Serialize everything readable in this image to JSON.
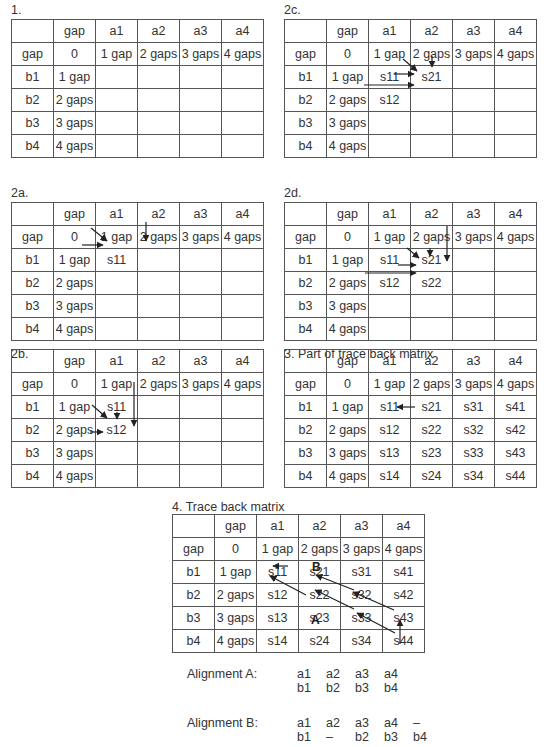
{
  "columns": [
    "",
    "gap",
    "a1",
    "a2",
    "a3",
    "a4"
  ],
  "panels": [
    {
      "id": "p1",
      "title": "1.",
      "rows": [
        [
          "gap",
          "0",
          "1 gap",
          "2 gaps",
          "3 gaps",
          "4 gaps"
        ],
        [
          "b1",
          "1 gap",
          "",
          "",
          "",
          ""
        ],
        [
          "b2",
          "2 gaps",
          "",
          "",
          "",
          ""
        ],
        [
          "b3",
          "3 gaps",
          "",
          "",
          "",
          ""
        ],
        [
          "b4",
          "4 gaps",
          "",
          "",
          "",
          ""
        ]
      ]
    },
    {
      "id": "p2c",
      "title": "2c.",
      "rows": [
        [
          "gap",
          "0",
          "1 gap",
          "2 gaps",
          "3 gaps",
          "4 gaps"
        ],
        [
          "b1",
          "1 gap",
          "s11",
          "s21",
          "",
          ""
        ],
        [
          "b2",
          "2 gaps",
          "s12",
          "",
          "",
          ""
        ],
        [
          "b3",
          "3 gaps",
          "",
          "",
          "",
          ""
        ],
        [
          "b4",
          "4 gaps",
          "",
          "",
          "",
          ""
        ]
      ]
    },
    {
      "id": "p2a",
      "title": "2a.",
      "rows": [
        [
          "gap",
          "0",
          "1 gap",
          "2 gaps",
          "3 gaps",
          "4 gaps"
        ],
        [
          "b1",
          "1 gap",
          "s11",
          "",
          "",
          ""
        ],
        [
          "b2",
          "2 gaps",
          "",
          "",
          "",
          ""
        ],
        [
          "b3",
          "3 gaps",
          "",
          "",
          "",
          ""
        ],
        [
          "b4",
          "4 gaps",
          "",
          "",
          "",
          ""
        ]
      ]
    },
    {
      "id": "p2d",
      "title": "2d.",
      "rows": [
        [
          "gap",
          "0",
          "1 gap",
          "2 gaps",
          "3 gaps",
          "4 gaps"
        ],
        [
          "b1",
          "1 gap",
          "s11",
          "s21",
          "",
          ""
        ],
        [
          "b2",
          "2 gaps",
          "s12",
          "s22",
          "",
          ""
        ],
        [
          "b3",
          "3 gaps",
          "",
          "",
          "",
          ""
        ],
        [
          "b4",
          "4 gaps",
          "",
          "",
          "",
          ""
        ]
      ]
    },
    {
      "id": "p2b",
      "title": "2b.",
      "rows": [
        [
          "gap",
          "0",
          "1 gap",
          "2 gaps",
          "3 gaps",
          "4 gaps"
        ],
        [
          "b1",
          "1 gap",
          "s11",
          "",
          "",
          ""
        ],
        [
          "b2",
          "2 gaps",
          "s12",
          "",
          "",
          ""
        ],
        [
          "b3",
          "3 gaps",
          "",
          "",
          "",
          ""
        ],
        [
          "b4",
          "4 gaps",
          "",
          "",
          "",
          ""
        ]
      ]
    },
    {
      "id": "p3",
      "title": "3. Part of trace back matrix",
      "rows": [
        [
          "gap",
          "0",
          "1 gap",
          "2 gaps",
          "3 gaps",
          "4 gaps"
        ],
        [
          "b1",
          "1 gap",
          "s11",
          "s21",
          "s31",
          "s41"
        ],
        [
          "b2",
          "2 gaps",
          "s12",
          "s22",
          "s32",
          "s42"
        ],
        [
          "b3",
          "3 gaps",
          "s13",
          "s23",
          "s33",
          "s43"
        ],
        [
          "b4",
          "4 gaps",
          "s14",
          "s24",
          "s34",
          "s44"
        ]
      ]
    },
    {
      "id": "p4",
      "title": "4. Trace back matrix",
      "rows": [
        [
          "gap",
          "0",
          "1 gap",
          "2 gaps",
          "3 gaps",
          "4 gaps"
        ],
        [
          "b1",
          "1 gap",
          "s11",
          "s21",
          "s31",
          "s41"
        ],
        [
          "b2",
          "2 gaps",
          "s12",
          "s22",
          "s32",
          "s42"
        ],
        [
          "b3",
          "3 gaps",
          "s13",
          "s23",
          "s33",
          "s43"
        ],
        [
          "b4",
          "4 gaps",
          "s14",
          "s24",
          "s34",
          "s44"
        ]
      ],
      "path_labels": {
        "A": "A",
        "B": "B"
      }
    }
  ],
  "alignments": [
    {
      "label": "Alignment A:",
      "top": [
        "a1",
        "a2",
        "a3",
        "a4",
        ""
      ],
      "bottom": [
        "b1",
        "b2",
        "b3",
        "b4",
        ""
      ]
    },
    {
      "label": "Alignment B:",
      "top": [
        "a1",
        "a2",
        "a3",
        "a4",
        "–"
      ],
      "bottom": [
        "b1",
        "–",
        "b2",
        "b3",
        "b4"
      ]
    }
  ],
  "colors": {
    "line": "#333333",
    "text": "#333333",
    "background": "#ffffff"
  }
}
